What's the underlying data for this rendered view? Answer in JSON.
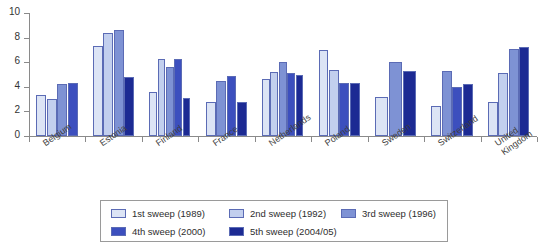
{
  "chart_data": {
    "type": "bar",
    "title": "",
    "subtitle": "",
    "xlabel": "",
    "ylabel": "",
    "ylim": [
      0,
      10
    ],
    "y_ticks": [
      0,
      2,
      4,
      6,
      8,
      10
    ],
    "grid": false,
    "legend_position": "bottom",
    "categories": [
      "Belgium",
      "Estonia",
      "Finland",
      "France",
      "Netherlands",
      "Poland",
      "Sweden",
      "Switzerland",
      "United Kingdom"
    ],
    "series": [
      {
        "name": "1st sweep (1989)",
        "color": "#dce4f5",
        "values": [
          3.3,
          7.3,
          3.6,
          2.8,
          4.6,
          7.0,
          3.2,
          2.4,
          2.8
        ]
      },
      {
        "name": "2nd sweep (1992)",
        "color": "#c2cfee",
        "values": [
          3.0,
          8.4,
          6.3,
          null,
          5.2,
          5.4,
          null,
          null,
          5.1
        ]
      },
      {
        "name": "3rd sweep (1996)",
        "color": "#7e92d4",
        "values": [
          4.2,
          8.6,
          5.6,
          4.5,
          6.0,
          null,
          6.0,
          5.3,
          7.1
        ]
      },
      {
        "name": "4th sweep (2000)",
        "color": "#3c4fbe",
        "values": [
          4.3,
          null,
          6.3,
          4.9,
          5.1,
          4.3,
          null,
          4.0,
          null
        ]
      },
      {
        "name": "5th sweep (2004/05)",
        "color": "#1c2a93",
        "values": [
          null,
          4.8,
          3.1,
          2.8,
          5.0,
          4.3,
          5.3,
          4.2,
          7.2
        ]
      }
    ]
  },
  "legend": {
    "items": [
      {
        "label": "1st sweep (1989)",
        "color": "#dce4f5"
      },
      {
        "label": "2nd sweep (1992)",
        "color": "#c2cfee"
      },
      {
        "label": "3rd sweep (1996)",
        "color": "#7e92d4"
      },
      {
        "label": "4th sweep (2000)",
        "color": "#3c4fbe"
      },
      {
        "label": "5th sweep (2004/05)",
        "color": "#1c2a93"
      }
    ]
  },
  "axis": {
    "y_tick_labels": [
      "0",
      "2",
      "4",
      "6",
      "8",
      "10"
    ]
  }
}
